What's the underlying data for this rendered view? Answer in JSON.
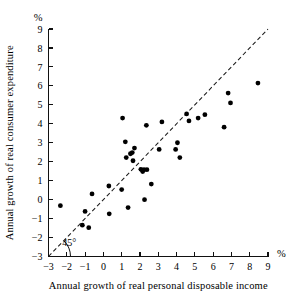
{
  "figure": {
    "background": "#ffffff",
    "ink_color": "#000000"
  },
  "chart_data": {
    "type": "scatter",
    "title": "",
    "subtitle": "",
    "xlabel": "Annual growth of real personal disposable income",
    "ylabel": "Annual growth of real consumer expenditure",
    "x_unit_label": "%",
    "y_unit_label": "%",
    "xlim": [
      -3,
      9
    ],
    "ylim": [
      -3,
      9
    ],
    "xticks": [
      -3,
      -2,
      -1,
      0,
      1,
      2,
      3,
      4,
      5,
      6,
      7,
      8,
      9
    ],
    "yticks": [
      -3,
      -2,
      -1,
      0,
      1,
      2,
      3,
      4,
      5,
      6,
      7,
      8,
      9
    ],
    "xtick_labels": [
      "−3",
      "−2",
      "−1",
      "0",
      "1",
      "2",
      "3",
      "4",
      "5",
      "6",
      "7",
      "8",
      "9"
    ],
    "ytick_labels": [
      "−3",
      "−2",
      "−1",
      "0",
      "1",
      "2",
      "3",
      "4",
      "5",
      "6",
      "7",
      "8",
      "9"
    ],
    "grid": false,
    "legend": null,
    "legend_position": "none",
    "marker": "filled-circle",
    "marker_color": "#000000",
    "marker_size_px": 2.4,
    "reference_line": {
      "name": "45-degree line",
      "label": "45°",
      "style": "dashed",
      "slope": 1,
      "intercept": 0,
      "from": [
        -3,
        -3
      ],
      "to": [
        9,
        9
      ]
    },
    "annotations": [
      {
        "text": "45°",
        "x": -2.25,
        "y": -2.45
      }
    ],
    "points": [
      {
        "x": -2.35,
        "y": -0.32
      },
      {
        "x": -1.15,
        "y": -1.35
      },
      {
        "x": -1.0,
        "y": -0.62
      },
      {
        "x": -0.8,
        "y": -1.48
      },
      {
        "x": -0.62,
        "y": 0.3
      },
      {
        "x": 0.3,
        "y": 0.72
      },
      {
        "x": 0.32,
        "y": -0.75
      },
      {
        "x": 1.0,
        "y": 0.53
      },
      {
        "x": 1.05,
        "y": 4.3
      },
      {
        "x": 1.2,
        "y": 3.05
      },
      {
        "x": 1.25,
        "y": 2.22
      },
      {
        "x": 1.35,
        "y": -0.42
      },
      {
        "x": 1.48,
        "y": 2.42
      },
      {
        "x": 1.58,
        "y": 2.48
      },
      {
        "x": 1.62,
        "y": 2.05
      },
      {
        "x": 1.7,
        "y": 2.72
      },
      {
        "x": 2.05,
        "y": 1.6
      },
      {
        "x": 2.15,
        "y": 1.48
      },
      {
        "x": 2.22,
        "y": 1.58
      },
      {
        "x": 2.25,
        "y": 0.0
      },
      {
        "x": 2.35,
        "y": 3.92
      },
      {
        "x": 2.38,
        "y": 1.58
      },
      {
        "x": 2.62,
        "y": 0.82
      },
      {
        "x": 3.05,
        "y": 2.65
      },
      {
        "x": 3.2,
        "y": 4.1
      },
      {
        "x": 3.95,
        "y": 2.65
      },
      {
        "x": 4.05,
        "y": 3.0
      },
      {
        "x": 4.18,
        "y": 2.22
      },
      {
        "x": 4.55,
        "y": 4.52
      },
      {
        "x": 4.68,
        "y": 4.15
      },
      {
        "x": 5.18,
        "y": 4.3
      },
      {
        "x": 5.55,
        "y": 4.48
      },
      {
        "x": 6.6,
        "y": 3.82
      },
      {
        "x": 6.82,
        "y": 5.62
      },
      {
        "x": 6.95,
        "y": 5.1
      },
      {
        "x": 8.45,
        "y": 6.15
      }
    ]
  },
  "axes": {
    "x_axis_name": "x-axis",
    "y_axis_name": "y-axis"
  }
}
